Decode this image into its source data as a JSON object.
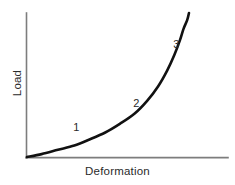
{
  "chart_data": {
    "type": "line",
    "title": "",
    "xlabel": "Deformation",
    "ylabel": "Load",
    "grid": false,
    "legend": null,
    "xlim": [
      0,
      1
    ],
    "ylim": [
      0,
      1
    ],
    "axis_ticks": {
      "x": [],
      "y": []
    },
    "series": [
      {
        "name": "load-deformation",
        "color": "#111111",
        "x": [
          0.0,
          0.08,
          0.17,
          0.26,
          0.34,
          0.43,
          0.51,
          0.59,
          0.66,
          0.72,
          0.77,
          0.81,
          0.84,
          0.86,
          0.88,
          0.89
        ],
        "y": [
          0.0,
          0.02,
          0.05,
          0.08,
          0.12,
          0.17,
          0.23,
          0.3,
          0.39,
          0.49,
          0.6,
          0.71,
          0.81,
          0.89,
          0.95,
          1.0
        ]
      }
    ],
    "annotations": [
      {
        "text": "1",
        "x": 0.27,
        "y": 0.2,
        "region": "initial-toe-region"
      },
      {
        "text": "2",
        "x": 0.6,
        "y": 0.37,
        "region": "transition-region"
      },
      {
        "text": "3",
        "x": 0.82,
        "y": 0.78,
        "region": "steep-rise-region"
      }
    ]
  },
  "figure": {
    "xlabel": "Deformation",
    "ylabel": "Load",
    "annotations": [
      {
        "label": "1"
      },
      {
        "label": "2"
      },
      {
        "label": "3"
      }
    ],
    "colors": {
      "background": "#ffffff",
      "axis": "#7d7d7d",
      "curve": "#111111",
      "text": "#2a2a2a"
    }
  }
}
